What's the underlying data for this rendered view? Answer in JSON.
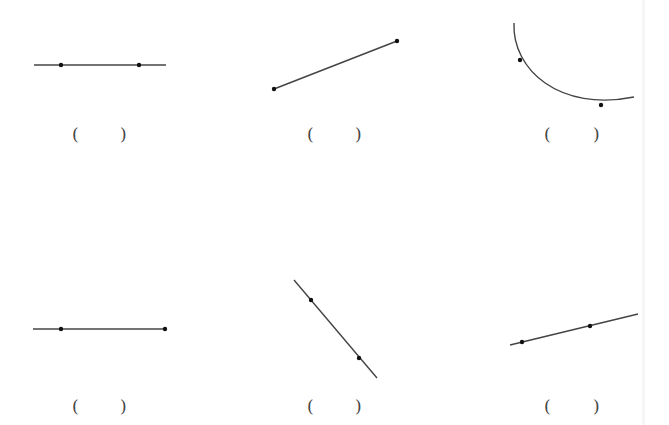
{
  "figures": [
    {
      "id": 1,
      "kind": "line",
      "path": {
        "x1": 34,
        "y1": 65,
        "x2": 166,
        "y2": 65
      },
      "points": [
        {
          "x": 61,
          "y": 65
        },
        {
          "x": 139,
          "y": 65
        }
      ],
      "answer": {
        "open": "(",
        "close": ")",
        "open_x": 72,
        "close_x": 120,
        "y": 126
      }
    },
    {
      "id": 2,
      "kind": "segment",
      "path": {
        "x1": 274,
        "y1": 89,
        "x2": 397,
        "y2": 41
      },
      "points": [
        {
          "x": 274,
          "y": 89
        },
        {
          "x": 397,
          "y": 41
        }
      ],
      "answer": {
        "open": "(",
        "close": ")",
        "open_x": 307,
        "close_x": 355,
        "y": 126
      }
    },
    {
      "id": 3,
      "kind": "arc",
      "path": {
        "d": "M 514 23 C 512 70, 560 112, 634 97"
      },
      "points": [
        {
          "x": 520,
          "y": 60
        },
        {
          "x": 601,
          "y": 105
        }
      ],
      "answer": {
        "open": "(",
        "close": ")",
        "open_x": 544,
        "close_x": 593,
        "y": 126
      }
    },
    {
      "id": 4,
      "kind": "ray",
      "path": {
        "x1": 33,
        "y1": 329,
        "x2": 165,
        "y2": 329
      },
      "points": [
        {
          "x": 61,
          "y": 329
        },
        {
          "x": 165,
          "y": 329
        }
      ],
      "answer": {
        "open": "(",
        "close": ")",
        "open_x": 72,
        "close_x": 120,
        "y": 398
      }
    },
    {
      "id": 5,
      "kind": "line",
      "path": {
        "x1": 294,
        "y1": 280,
        "x2": 377,
        "y2": 378
      },
      "points": [
        {
          "x": 311,
          "y": 300
        },
        {
          "x": 359,
          "y": 358
        }
      ],
      "answer": {
        "open": "(",
        "close": ")",
        "open_x": 307,
        "close_x": 355,
        "y": 398
      }
    },
    {
      "id": 6,
      "kind": "line",
      "path": {
        "x1": 510,
        "y1": 345,
        "x2": 638,
        "y2": 314
      },
      "points": [
        {
          "x": 522,
          "y": 342
        },
        {
          "x": 590,
          "y": 326
        }
      ],
      "answer": {
        "open": "(",
        "close": ")",
        "open_x": 544,
        "close_x": 593,
        "y": 398
      }
    }
  ],
  "style": {
    "stroke": "#444444",
    "point": "#111111"
  }
}
